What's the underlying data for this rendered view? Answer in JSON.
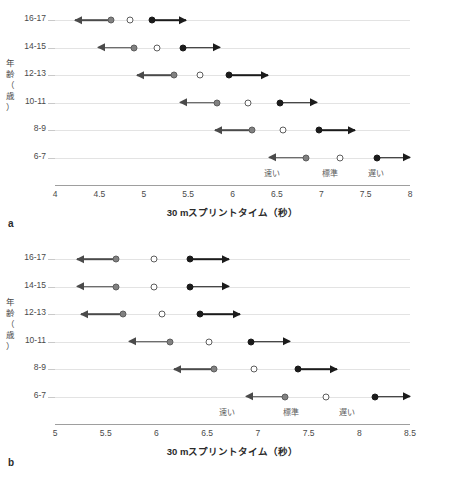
{
  "figure": {
    "panels": [
      {
        "letter": "a",
        "ylabel_chars": [
          "年",
          "齢",
          "（",
          "歳",
          "）"
        ],
        "chart_data": {
          "type": "scatter",
          "title": "",
          "xlabel": "30 mスプリントタイム（秒）",
          "ylabel": "年齢（歳）",
          "xlim": [
            4,
            8
          ],
          "xticks": [
            4,
            4.5,
            5,
            5.5,
            6,
            6.5,
            7,
            7.5,
            8
          ],
          "xtick_labels": [
            "4",
            "4.5",
            "5",
            "5.5",
            "6",
            "6.5",
            "7",
            "7.5",
            "8"
          ],
          "categories": [
            "16-17",
            "14-15",
            "12-13",
            "10-11",
            "8-9",
            "6-7"
          ],
          "grid": true,
          "legend_position": "inside-bottom",
          "series": [
            {
              "name": "速い",
              "marker": "filled-gray",
              "values": [
                4.63,
                4.89,
                5.34,
                5.83,
                6.22,
                6.83
              ]
            },
            {
              "name": "標準",
              "marker": "open-circle",
              "values": [
                4.85,
                5.15,
                5.63,
                6.17,
                6.57,
                7.21
              ]
            },
            {
              "name": "遅い",
              "marker": "filled-black",
              "values": [
                5.09,
                5.44,
                5.96,
                6.53,
                6.97,
                7.63
              ]
            }
          ],
          "arrows": [
            {
              "category": "16-17",
              "from": 4.63,
              "to": 4.22,
              "direction": "left"
            },
            {
              "category": "16-17",
              "from": 5.09,
              "to": 5.48,
              "direction": "right"
            },
            {
              "category": "14-15",
              "from": 4.89,
              "to": 4.48,
              "direction": "left"
            },
            {
              "category": "14-15",
              "from": 5.44,
              "to": 5.86,
              "direction": "right"
            },
            {
              "category": "12-13",
              "from": 5.34,
              "to": 4.92,
              "direction": "left"
            },
            {
              "category": "12-13",
              "from": 5.96,
              "to": 6.4,
              "direction": "right"
            },
            {
              "category": "10-11",
              "from": 5.83,
              "to": 5.41,
              "direction": "left"
            },
            {
              "category": "10-11",
              "from": 6.53,
              "to": 6.95,
              "direction": "right"
            },
            {
              "category": "8-9",
              "from": 6.22,
              "to": 5.8,
              "direction": "left"
            },
            {
              "category": "8-9",
              "from": 6.97,
              "to": 7.38,
              "direction": "right"
            },
            {
              "category": "6-7",
              "from": 6.83,
              "to": 6.41,
              "direction": "left"
            },
            {
              "category": "6-7",
              "from": 7.63,
              "to": 8.0,
              "direction": "right"
            }
          ],
          "zone_labels": [
            {
              "text": "速い",
              "x": 6.45
            },
            {
              "text": "標準",
              "x": 7.1
            },
            {
              "text": "遅い",
              "x": 7.62
            }
          ]
        }
      },
      {
        "letter": "b",
        "ylabel_chars": [
          "年",
          "齢",
          "（",
          "歳",
          "）"
        ],
        "chart_data": {
          "type": "scatter",
          "title": "",
          "xlabel": "30 mスプリントタイム（秒）",
          "ylabel": "年齢（歳）",
          "xlim": [
            5,
            8.5
          ],
          "xticks": [
            5,
            5.5,
            6,
            6.5,
            7,
            7.5,
            8,
            8.5
          ],
          "xtick_labels": [
            "5",
            "5.5",
            "6",
            "6.5",
            "7",
            "7.5",
            "8",
            "8.5"
          ],
          "categories": [
            "16-17",
            "14-15",
            "12-13",
            "10-11",
            "8-9",
            "6-7"
          ],
          "grid": true,
          "legend_position": "inside-bottom",
          "series": [
            {
              "name": "速い",
              "marker": "filled-gray",
              "values": [
                5.6,
                5.6,
                5.67,
                6.13,
                6.57,
                7.27
              ]
            },
            {
              "name": "標準",
              "marker": "open-circle",
              "values": [
                5.98,
                5.98,
                6.05,
                6.52,
                6.96,
                7.67
              ]
            },
            {
              "name": "遅い",
              "marker": "filled-black",
              "values": [
                6.33,
                6.33,
                6.43,
                6.93,
                7.4,
                8.15
              ]
            }
          ],
          "arrows": [
            {
              "category": "16-17",
              "from": 5.6,
              "to": 5.22,
              "direction": "left"
            },
            {
              "category": "16-17",
              "from": 6.33,
              "to": 6.72,
              "direction": "right"
            },
            {
              "category": "14-15",
              "from": 5.6,
              "to": 5.22,
              "direction": "left"
            },
            {
              "category": "14-15",
              "from": 6.33,
              "to": 6.72,
              "direction": "right"
            },
            {
              "category": "12-13",
              "from": 5.67,
              "to": 5.26,
              "direction": "left"
            },
            {
              "category": "12-13",
              "from": 6.43,
              "to": 6.82,
              "direction": "right"
            },
            {
              "category": "10-11",
              "from": 6.13,
              "to": 5.73,
              "direction": "left"
            },
            {
              "category": "10-11",
              "from": 6.93,
              "to": 7.32,
              "direction": "right"
            },
            {
              "category": "8-9",
              "from": 6.57,
              "to": 6.17,
              "direction": "left"
            },
            {
              "category": "8-9",
              "from": 7.4,
              "to": 7.78,
              "direction": "right"
            },
            {
              "category": "6-7",
              "from": 7.27,
              "to": 6.88,
              "direction": "left"
            },
            {
              "category": "6-7",
              "from": 8.15,
              "to": 8.5,
              "direction": "right"
            }
          ],
          "zone_labels": [
            {
              "text": "速い",
              "x": 6.7
            },
            {
              "text": "標準",
              "x": 7.33
            },
            {
              "text": "遅い",
              "x": 7.88
            }
          ]
        }
      }
    ]
  }
}
